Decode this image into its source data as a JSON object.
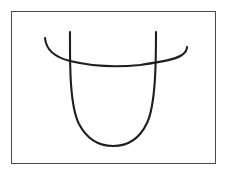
{
  "figure": {
    "title": "",
    "background_color": "#ffffff",
    "frame": {
      "name": "figure-border",
      "x": 11,
      "y": 11,
      "width": 205,
      "height": 153,
      "stroke_color": "#4a4a4a",
      "stroke_width": 1,
      "fill_color": "#ffffff"
    },
    "stroke_color": "#1e1e1e",
    "stroke_width": 2.1,
    "strokes": [
      {
        "name": "u-curve",
        "description": "tall narrow U shape with rounded bottom",
        "path": "M 70 32 C 70 58 69 104 79 124 C 88 141 101 146 113 146 C 126 146 139 140 147 123 C 156 104 156 58 156 32",
        "start_point": [
          70,
          32
        ],
        "end_point": [
          156,
          32
        ],
        "bottom_point": [
          113,
          146
        ]
      },
      {
        "name": "horizontal-hooked-curve",
        "description": "shallow downward arc crossing the U, hooked up at both ends",
        "path": "M 45 38 C 46 50 54 57 70 61 C 95 67 120 67 140 65 C 160 62 174 60 182 55 C 186 52 187 50 187 47",
        "start_point": [
          45,
          38
        ],
        "end_point": [
          187,
          47
        ],
        "low_point": [
          125,
          66
        ]
      }
    ],
    "intersections": [
      {
        "name": "left-crossing",
        "x": 70,
        "y": 61
      },
      {
        "name": "right-crossing",
        "x": 155,
        "y": 64
      }
    ]
  }
}
